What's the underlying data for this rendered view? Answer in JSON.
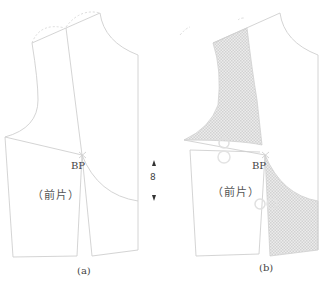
{
  "figure": {
    "panels": [
      {
        "id": "a",
        "caption": "(a)",
        "bp_label": "BP",
        "piece_label": "（前片）"
      },
      {
        "id": "b",
        "caption": "(b)",
        "bp_label": "BP",
        "piece_label": "（前片）"
      }
    ],
    "measurement": {
      "value": "8",
      "note": "dart intake indicator with up/down arrows"
    },
    "colors": {
      "line": "#cfcfcf",
      "hatch": "#d8d8d8",
      "text": "#444444"
    }
  }
}
